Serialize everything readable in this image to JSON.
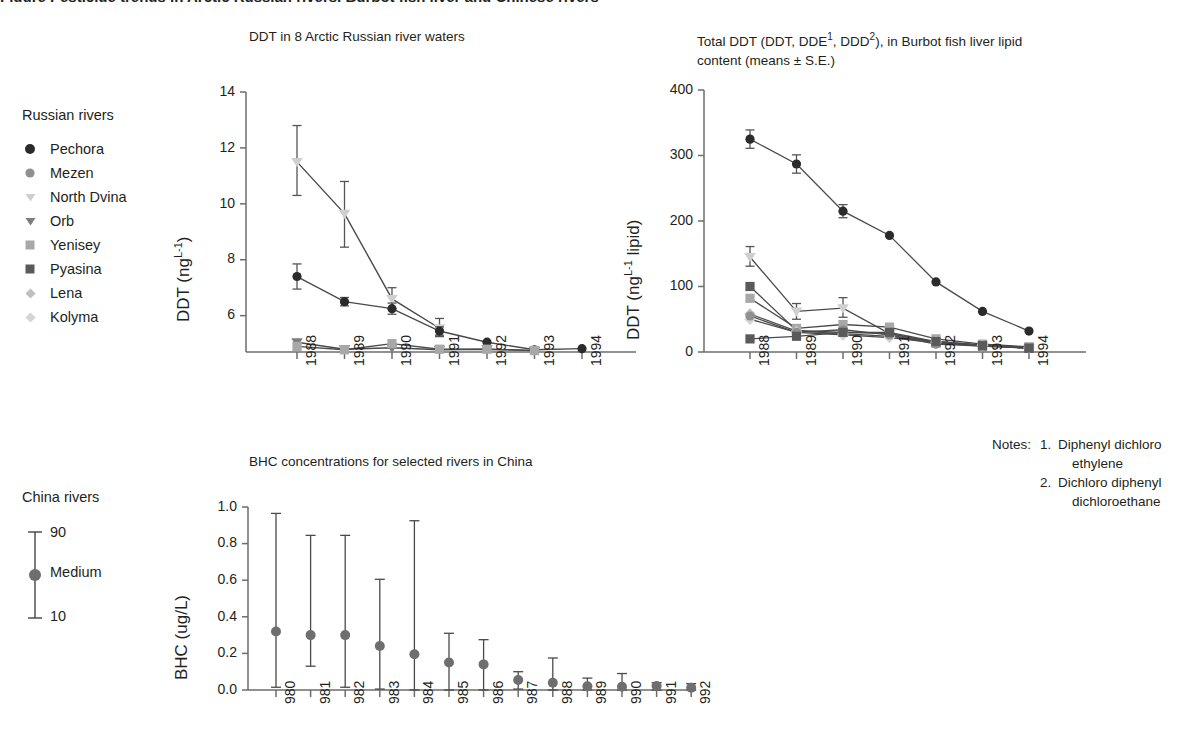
{
  "page": {
    "cut_off_top_title": "Figure  Pesticide trends in Arctic Russian rivers, Burbot fish liver and Chinese rivers"
  },
  "panel1": {
    "title": "DDT in 8 Arctic Russian river waters",
    "legend_title": "Russian rivers",
    "legend": [
      {
        "label": "Pechora",
        "marker": "circle",
        "color": "#2b2b2b"
      },
      {
        "label": "Mezen",
        "marker": "circle",
        "color": "#909090"
      },
      {
        "label": "North Dvina",
        "marker": "triangle",
        "color": "#cfcfcf"
      },
      {
        "label": "Orb",
        "marker": "triangle",
        "color": "#7d7d7d"
      },
      {
        "label": "Yenisey",
        "marker": "square",
        "color": "#a8a8a8"
      },
      {
        "label": "Pyasina",
        "marker": "square",
        "color": "#5a5a5a"
      },
      {
        "label": "Lena",
        "marker": "diamond",
        "color": "#bfbfbf"
      },
      {
        "label": "Kolyma",
        "marker": "diamond",
        "color": "#d4d4d4"
      }
    ]
  },
  "panel2": {
    "title_line1": "Total DDT (DDT, DDE",
    "title_sup1": "1",
    "title_line1b": ", DDD",
    "title_sup2": "2",
    "title_line1c": "), in Burbot fish liver lipid",
    "title_line2": "content (means ± S.E.)"
  },
  "panel3": {
    "title": "BHC concentrations for selected rivers in China",
    "legend_title": "China rivers",
    "legend": [
      {
        "label": "90"
      },
      {
        "label": "Medium"
      },
      {
        "label": "10"
      }
    ]
  },
  "notes": {
    "label": "Notes:",
    "items": [
      {
        "num": "1.",
        "line1": "Diphenyl dichloro",
        "line2": "ethylene"
      },
      {
        "num": "2.",
        "line1": "Dichloro diphenyl",
        "line2": "dichloroethane"
      }
    ]
  },
  "chart_data": [
    {
      "type": "line",
      "id": "ddt-arctic-russian-rivers",
      "title": "DDT in 8 Arctic Russian river waters",
      "xlabel": "",
      "ylabel": "DDT (ng L-1)",
      "ylabel_display": "DDT (ng",
      "ylabel_sup": "L-1",
      "ylabel_tail": ")",
      "categories": [
        "1988",
        "1989",
        "1990",
        "1991",
        "1992",
        "1993",
        "1994"
      ],
      "yticks": [
        6,
        8,
        10,
        12,
        14
      ],
      "ytick_labels": [
        "6",
        "8",
        "10",
        "12",
        "14"
      ],
      "ylim": [
        4.7,
        14
      ],
      "grid": false,
      "errorbars": true,
      "series": [
        {
          "name": "North Dvina",
          "marker": "triangle",
          "color": "#cfcfcf",
          "values": [
            11.5,
            9.65,
            6.6,
            5.55,
            null,
            null,
            null
          ],
          "err_lo": [
            1.2,
            1.2,
            0.35,
            0.3,
            null,
            null,
            null
          ],
          "err_hi": [
            1.3,
            1.15,
            0.4,
            0.35,
            null,
            null,
            null
          ]
        },
        {
          "name": "Pechora",
          "marker": "circle",
          "color": "#2b2b2b",
          "values": [
            7.4,
            6.5,
            6.25,
            5.45,
            5.05,
            4.78,
            4.82
          ],
          "err_lo": [
            0.45,
            0.15,
            0.2,
            0.15,
            0,
            0,
            0
          ],
          "err_hi": [
            0.45,
            0.15,
            0.2,
            0.15,
            0,
            0,
            0
          ]
        },
        {
          "name": "Orb",
          "marker": "triangle",
          "color": "#7d7d7d",
          "values": [
            5.05,
            4.8,
            4.85,
            4.78,
            4.8,
            4.75,
            null
          ],
          "err_lo": [
            0,
            0,
            0,
            0,
            0,
            0,
            null
          ],
          "err_hi": [
            0,
            0,
            0,
            0,
            0,
            0,
            null
          ]
        },
        {
          "name": "Yenisey",
          "marker": "square",
          "color": "#a8a8a8",
          "values": [
            4.9,
            4.78,
            5.0,
            4.8,
            4.8,
            4.75,
            null
          ],
          "err_lo": [
            0,
            0,
            0,
            0,
            0,
            0,
            null
          ],
          "err_hi": [
            0,
            0,
            0,
            0,
            0,
            0,
            null
          ]
        }
      ]
    },
    {
      "type": "line",
      "id": "total-ddt-burbot-liver",
      "title": "Total DDT (DDT, DDE1, DDD2), in Burbot fish liver lipid content (means ± S.E.)",
      "xlabel": "",
      "ylabel": "DDT (ng L-1 lipid)",
      "ylabel_display": "DDT (ng",
      "ylabel_sup": "L-1",
      "ylabel_tail": " lipid)",
      "categories": [
        "1988",
        "1989",
        "1990",
        "1991",
        "1992",
        "1993",
        "1994"
      ],
      "yticks": [
        0,
        100,
        200,
        300,
        400
      ],
      "ytick_labels": [
        "0",
        "100",
        "200",
        "300",
        "400"
      ],
      "ylim": [
        0,
        400
      ],
      "grid": false,
      "errorbars": true,
      "series": [
        {
          "name": "Pechora",
          "marker": "circle",
          "color": "#2b2b2b",
          "values": [
            325,
            287,
            215,
            178,
            107,
            62,
            32
          ],
          "err_lo": [
            14,
            14,
            10,
            0,
            0,
            0,
            0
          ],
          "err_hi": [
            14,
            14,
            10,
            0,
            0,
            0,
            0
          ]
        },
        {
          "name": "North Dvina",
          "marker": "triangle",
          "color": "#cfcfcf",
          "values": [
            145,
            62,
            67,
            28,
            15,
            10,
            6
          ],
          "err_lo": [
            14,
            12,
            14,
            0,
            0,
            0,
            0
          ],
          "err_hi": [
            16,
            12,
            16,
            0,
            0,
            0,
            0
          ]
        },
        {
          "name": "Pyasina",
          "marker": "square",
          "color": "#5a5a5a",
          "values": [
            100,
            33,
            30,
            28,
            14,
            9,
            6
          ],
          "err_lo": [
            0,
            0,
            0,
            0,
            0,
            0,
            0
          ],
          "err_hi": [
            0,
            0,
            0,
            0,
            0,
            0,
            0
          ]
        },
        {
          "name": "Yenisey",
          "marker": "square",
          "color": "#a8a8a8",
          "values": [
            82,
            36,
            42,
            38,
            20,
            12,
            8
          ],
          "err_lo": [
            0,
            0,
            0,
            0,
            0,
            0,
            0
          ],
          "err_hi": [
            0,
            0,
            0,
            0,
            0,
            0,
            0
          ]
        },
        {
          "name": "Lena",
          "marker": "diamond",
          "color": "#bfbfbf",
          "values": [
            58,
            32,
            28,
            24,
            16,
            11,
            7
          ],
          "err_lo": [
            0,
            0,
            0,
            0,
            0,
            0,
            0
          ],
          "err_hi": [
            0,
            0,
            0,
            0,
            0,
            0,
            0
          ]
        },
        {
          "name": "Kolyma",
          "marker": "diamond",
          "color": "#d4d4d4",
          "values": [
            50,
            30,
            26,
            22,
            14,
            10,
            6
          ],
          "err_lo": [
            0,
            0,
            0,
            0,
            0,
            0,
            0
          ],
          "err_hi": [
            0,
            0,
            0,
            0,
            0,
            0,
            0
          ]
        },
        {
          "name": "Mezen",
          "marker": "circle",
          "color": "#909090",
          "values": [
            55,
            30,
            34,
            26,
            12,
            9,
            6
          ],
          "err_lo": [
            0,
            0,
            0,
            0,
            0,
            0,
            0
          ],
          "err_hi": [
            0,
            0,
            0,
            0,
            0,
            0,
            0
          ]
        },
        {
          "name": "Orb",
          "marker": "square",
          "color": "#5a5a5a",
          "values": [
            20,
            24,
            30,
            30,
            16,
            10,
            6
          ],
          "err_lo": [
            0,
            0,
            0,
            0,
            0,
            0,
            0
          ],
          "err_hi": [
            0,
            0,
            0,
            0,
            0,
            0,
            0
          ]
        }
      ]
    },
    {
      "type": "scatter",
      "id": "bhc-china-rivers",
      "title": "BHC concentrations for selected rivers in China",
      "xlabel": "",
      "ylabel": "BHC (ug/L)",
      "categories": [
        "980",
        "981",
        "982",
        "983",
        "984",
        "985",
        "986",
        "987",
        "988",
        "989",
        "990",
        "991",
        "992"
      ],
      "yticks": [
        0.0,
        0.2,
        0.4,
        0.6,
        0.8,
        1.0
      ],
      "ytick_labels": [
        "0.0",
        "0.2",
        "0.4",
        "0.6",
        "0.8",
        "1.0"
      ],
      "ylim": [
        0.0,
        1.0
      ],
      "grid": false,
      "errorbars": true,
      "marker": "circle",
      "color": "#6e6e6e",
      "values": [
        0.32,
        0.3,
        0.3,
        0.24,
        0.195,
        0.15,
        0.14,
        0.055,
        0.04,
        0.02,
        0.018,
        0.022,
        0.012
      ],
      "p90": [
        0.965,
        0.845,
        0.845,
        0.605,
        0.925,
        0.31,
        0.275,
        0.1,
        0.175,
        0.065,
        0.09,
        0.04,
        0.035
      ],
      "p10": [
        0.015,
        0.13,
        0.015,
        0.005,
        0.0,
        0.0,
        0.0,
        0.005,
        0.0,
        0.0,
        0.0,
        0.0,
        0.0
      ]
    }
  ]
}
